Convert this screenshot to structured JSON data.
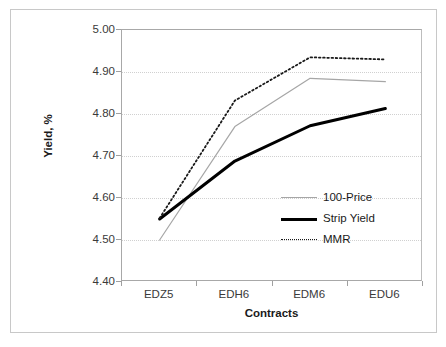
{
  "chart_data": {
    "type": "line",
    "title": "",
    "xlabel": "Contracts",
    "ylabel": "Yield, %",
    "categories": [
      "EDZ5",
      "EDH6",
      "EDM6",
      "EDU6"
    ],
    "ylim": [
      4.4,
      5.0
    ],
    "yticks": [
      "4.40",
      "4.50",
      "4.60",
      "4.70",
      "4.80",
      "4.90",
      "5.00"
    ],
    "ytick_values": [
      4.4,
      4.5,
      4.6,
      4.7,
      4.8,
      4.9,
      5.0
    ],
    "grid": true,
    "legend_position": "inside-right",
    "series": [
      {
        "name": "100-Price",
        "style": "thin-solid-gray",
        "color": "#a6a6a6",
        "values": [
          4.5,
          4.77,
          4.885,
          4.877
        ]
      },
      {
        "name": "Strip Yield",
        "style": "thick-solid-black",
        "color": "#000000",
        "values": [
          4.55,
          4.688,
          4.772,
          4.813
        ]
      },
      {
        "name": "MMR",
        "style": "dotted-black",
        "color": "#1a1a1a",
        "values": [
          4.552,
          4.832,
          4.935,
          4.93
        ]
      }
    ]
  },
  "axis": {
    "y_title": "Yield, %",
    "x_title": "Contracts",
    "y_tick_labels": [
      "5.00",
      "4.90",
      "4.80",
      "4.70",
      "4.60",
      "4.50",
      "4.40"
    ],
    "x_tick_labels": [
      "EDZ5",
      "EDH6",
      "EDM6",
      "EDU6"
    ]
  },
  "legend": {
    "items": [
      {
        "label": "100-Price"
      },
      {
        "label": "Strip Yield"
      },
      {
        "label": "MMR"
      }
    ]
  },
  "colors": {
    "frame_border": "#c8c8c8",
    "axis_line": "#a0a0a0",
    "gridline": "#d0d0d0",
    "series_thin": "#a6a6a6",
    "series_thick": "#000000",
    "series_dotted": "#1a1a1a",
    "text": "#1a1a1a",
    "background": "#ffffff"
  }
}
